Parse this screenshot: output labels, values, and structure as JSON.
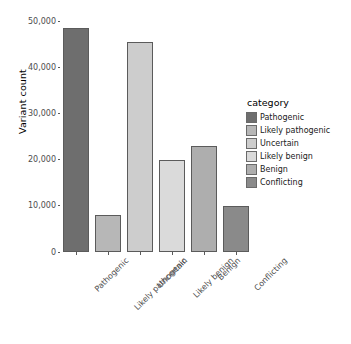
{
  "chart_data": {
    "type": "bar",
    "title": "",
    "xlabel": "",
    "ylabel": "Variant count",
    "categories": [
      "Pathogenic",
      "Likely pathogenic",
      "Uncertain",
      "Likely benign",
      "Benign",
      "Conflicting"
    ],
    "values": [
      48500,
      8000,
      45500,
      20000,
      23000,
      10000
    ],
    "ylim": [
      0,
      52000
    ],
    "y_ticks": [
      {
        "label": "0",
        "value": 0
      },
      {
        "label": "10,000",
        "value": 10000
      },
      {
        "label": "20,000",
        "value": 20000
      },
      {
        "label": "30,000",
        "value": 30000
      },
      {
        "label": "40,000",
        "value": 40000
      },
      {
        "label": "50,000",
        "value": 50000
      }
    ],
    "grid": false,
    "legend_position": "right",
    "legend": {
      "title": "category",
      "entries": [
        {
          "label": "Pathogenic",
          "color": "#6e6e6e"
        },
        {
          "label": "Likely pathogenic",
          "color": "#b7b7b7"
        },
        {
          "label": "Uncertain",
          "color": "#cdcdcd"
        },
        {
          "label": "Likely benign",
          "color": "#dadada"
        },
        {
          "label": "Benign",
          "color": "#aeaeae"
        },
        {
          "label": "Conflicting",
          "color": "#8a8a8a"
        }
      ]
    },
    "bar_colors": [
      "#6e6e6e",
      "#b7b7b7",
      "#cdcdcd",
      "#dadada",
      "#aeaeae",
      "#8a8a8a"
    ],
    "background": "#ffffff",
    "axis_color": "#4d4d4d"
  }
}
